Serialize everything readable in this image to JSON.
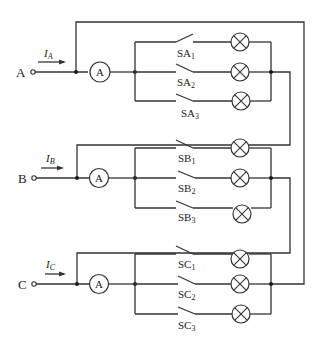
{
  "diagram": {
    "type": "three-phase lamp circuit with ammeters and switches",
    "colors": {
      "line": "#333333",
      "background": "#ffffff",
      "node": "#1a1a1a"
    },
    "phases": [
      {
        "terminal": "A",
        "current_symbol": "I",
        "current_sub": "A",
        "ammeter_label": "A",
        "switches": [
          {
            "base": "SA",
            "sub": "1"
          },
          {
            "base": "SA",
            "sub": "2"
          },
          {
            "base": "SA",
            "sub": "3"
          }
        ]
      },
      {
        "terminal": "B",
        "current_symbol": "I",
        "current_sub": "B",
        "ammeter_label": "A",
        "switches": [
          {
            "base": "SB",
            "sub": "1"
          },
          {
            "base": "SB",
            "sub": "2"
          },
          {
            "base": "SB",
            "sub": "3"
          }
        ]
      },
      {
        "terminal": "C",
        "current_symbol": "I",
        "current_sub": "C",
        "ammeter_label": "A",
        "switches": [
          {
            "base": "SC",
            "sub": "1"
          },
          {
            "base": "SC",
            "sub": "2"
          },
          {
            "base": "SC",
            "sub": "3"
          }
        ]
      }
    ],
    "lamp_icon": "lamp-cross-circle-icon"
  }
}
